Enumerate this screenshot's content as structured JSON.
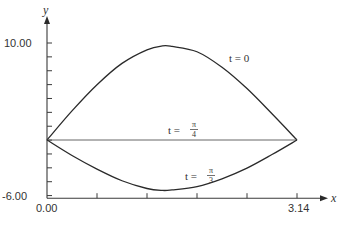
{
  "chart_data": {
    "type": "line",
    "title": "",
    "xlabel": "x",
    "ylabel": "y",
    "xlim": [
      0,
      3.14
    ],
    "ylim": [
      -6,
      10
    ],
    "x_tick_labels": [
      "0.00",
      "3.14"
    ],
    "y_tick_labels": [
      "10.00",
      "-6.00"
    ],
    "x_minor_ticks": 5,
    "y_minor_tick_step": 1.43,
    "grid": false,
    "series": [
      {
        "name": "t = 0",
        "label_main": "t = 0",
        "points": [
          [
            0,
            0
          ],
          [
            0.314,
            3.0
          ],
          [
            0.628,
            5.7
          ],
          [
            0.942,
            7.9
          ],
          [
            1.256,
            9.3
          ],
          [
            1.45,
            9.7
          ],
          [
            1.57,
            9.65
          ],
          [
            1.884,
            9.1
          ],
          [
            2.198,
            7.5
          ],
          [
            2.512,
            5.3
          ],
          [
            2.826,
            2.7
          ],
          [
            3.14,
            0
          ]
        ]
      },
      {
        "name": "t = π/4",
        "label_prefix": "t =",
        "label_num": "π",
        "label_den": "4",
        "points": [
          [
            0,
            0
          ],
          [
            3.14,
            0
          ]
        ]
      },
      {
        "name": "t = π/3",
        "label_prefix": "t =",
        "label_num": "π",
        "label_den": "3",
        "points": [
          [
            0,
            0
          ],
          [
            0.314,
            -1.6
          ],
          [
            0.628,
            -3.0
          ],
          [
            0.942,
            -4.2
          ],
          [
            1.256,
            -5.0
          ],
          [
            1.45,
            -5.2
          ],
          [
            1.57,
            -5.15
          ],
          [
            1.884,
            -4.8
          ],
          [
            2.198,
            -4.0
          ],
          [
            2.512,
            -2.9
          ],
          [
            2.826,
            -1.5
          ],
          [
            3.14,
            0
          ]
        ]
      }
    ]
  }
}
